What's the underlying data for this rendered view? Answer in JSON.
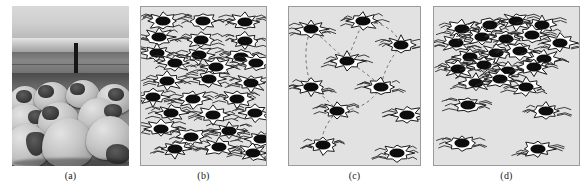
{
  "figure": {
    "width": 588,
    "height": 192,
    "background": "#ffffff",
    "panel_background": "#e2e2e2",
    "panel_border": "#9b9b9b",
    "ink": "#111111"
  },
  "panels": [
    {
      "id": "a",
      "caption": "(a)",
      "kind": "photograph",
      "description": "grayscale photograph of a flock of sheep in a field with fence post and mountains",
      "x": 12,
      "y": 6,
      "w": 117,
      "h": 160
    },
    {
      "id": "b",
      "caption": "(b)",
      "kind": "schematic",
      "description": "dense uniform arrangement of schematic sheep",
      "x": 140,
      "y": 6,
      "w": 127,
      "h": 160
    },
    {
      "id": "c",
      "caption": "(c)",
      "kind": "schematic",
      "description": "sparse arrangement of schematic sheep with dashed network links",
      "x": 288,
      "y": 6,
      "w": 133,
      "h": 160
    },
    {
      "id": "d",
      "caption": "(d)",
      "kind": "schematic",
      "description": "clustered arrangement of schematic sheep, dense at top-left and sparse at bottom",
      "x": 433,
      "y": 6,
      "w": 147,
      "h": 160
    }
  ],
  "sheep_icon": {
    "name": "sheep-icon",
    "head_color": "#0d0d0d",
    "wool_fill": "#ffffff",
    "wool_outline": "#1a1a1a",
    "wisp_color": "#2b2b2b"
  },
  "chart_data": {
    "type": "scatter",
    "title": "",
    "panels": [
      {
        "id": "b",
        "label": "(b)",
        "count": 23,
        "points": [
          [
            22,
            14
          ],
          [
            62,
            14
          ],
          [
            104,
            15
          ],
          [
            18,
            30
          ],
          [
            60,
            33
          ],
          [
            104,
            34
          ],
          [
            16,
            46
          ],
          [
            58,
            48
          ],
          [
            100,
            50
          ],
          [
            34,
            56
          ],
          [
            75,
            60
          ],
          [
            115,
            56
          ],
          [
            26,
            74
          ],
          [
            68,
            72
          ],
          [
            110,
            76
          ],
          [
            12,
            90
          ],
          [
            52,
            92
          ],
          [
            96,
            92
          ],
          [
            30,
            106
          ],
          [
            72,
            108
          ],
          [
            114,
            106
          ],
          [
            20,
            122
          ],
          [
            50,
            130
          ],
          [
            88,
            124
          ],
          [
            120,
            132
          ],
          [
            34,
            142
          ],
          [
            78,
            140
          ],
          [
            112,
            146
          ]
        ]
      },
      {
        "id": "c",
        "label": "(c)",
        "count": 11,
        "points": [
          [
            22,
            22
          ],
          [
            74,
            14
          ],
          [
            112,
            38
          ],
          [
            58,
            54
          ],
          [
            22,
            80
          ],
          [
            92,
            80
          ],
          [
            48,
            104
          ],
          [
            118,
            108
          ],
          [
            34,
            138
          ],
          [
            108,
            146
          ]
        ],
        "links": [
          [
            0,
            3
          ],
          [
            3,
            1
          ],
          [
            1,
            2
          ],
          [
            2,
            5
          ],
          [
            5,
            6
          ],
          [
            6,
            4
          ],
          [
            4,
            0
          ],
          [
            3,
            5
          ],
          [
            6,
            8
          ]
        ]
      },
      {
        "id": "d",
        "label": "(d)",
        "count": 24,
        "points": [
          [
            28,
            22
          ],
          [
            56,
            18
          ],
          [
            82,
            14
          ],
          [
            108,
            18
          ],
          [
            22,
            36
          ],
          [
            48,
            30
          ],
          [
            72,
            32
          ],
          [
            98,
            28
          ],
          [
            126,
            36
          ],
          [
            36,
            50
          ],
          [
            62,
            46
          ],
          [
            86,
            44
          ],
          [
            110,
            52
          ],
          [
            24,
            62
          ],
          [
            50,
            58
          ],
          [
            74,
            64
          ],
          [
            100,
            60
          ],
          [
            42,
            76
          ],
          [
            66,
            72
          ],
          [
            92,
            80
          ],
          [
            34,
            98
          ],
          [
            112,
            104
          ],
          [
            28,
            136
          ],
          [
            104,
            142
          ]
        ]
      }
    ]
  }
}
